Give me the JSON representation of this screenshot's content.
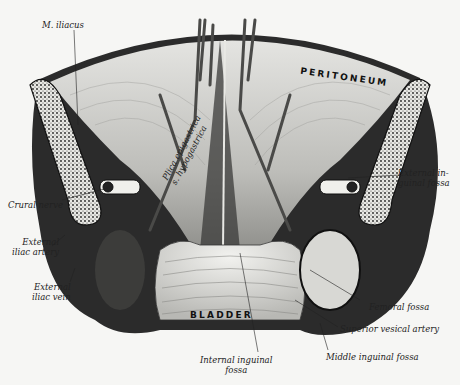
{
  "figure": {
    "type": "anatomical illustration",
    "colors": {
      "background": "#f6f6f4",
      "ink": "#111111",
      "tissue_light": "#d9d9d6",
      "tissue_dark": "#2a2a2a"
    }
  },
  "labels": {
    "m_iliacus": "M. iliacus",
    "peritoneum": "PERITONEUM",
    "plica_epigastrica_1": "Plica epigastrica",
    "plica_epigastrica_2": "s. hypogastrica",
    "external_inguinal_fossa_1": "External in-",
    "external_inguinal_fossa_2": "guinal fossa",
    "crural_nerve": "Crural nerve",
    "external_iliac_artery_1": "External",
    "external_iliac_artery_2": "iliac artery",
    "external_iliac_vein_1": "External",
    "external_iliac_vein_2": "iliac vein",
    "bladder": "BLADDER",
    "femoral_fossa": "Femoral fossa",
    "superior_vesical_artery": "Superior vesical artery",
    "middle_inguinal_fossa": "Middle inguinal fossa",
    "internal_inguinal_fossa_1": "Internal inguinal",
    "internal_inguinal_fossa_2": "fossa"
  }
}
